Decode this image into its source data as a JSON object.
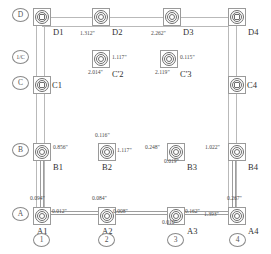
{
  "drawing": {
    "title": "Column Grid Deviation Plan",
    "unit_symbol": "\"",
    "row_bubbles": [
      {
        "label": "D",
        "x": 12,
        "y": 8
      },
      {
        "label": "1/C",
        "x": 12,
        "y": 50
      },
      {
        "label": "C",
        "x": 12,
        "y": 76
      },
      {
        "label": "B",
        "x": 12,
        "y": 143
      },
      {
        "label": "A",
        "x": 12,
        "y": 207
      }
    ],
    "column_bubbles": [
      {
        "label": "1",
        "x": 33,
        "y": 233
      },
      {
        "label": "2",
        "x": 98,
        "y": 233
      },
      {
        "label": "3",
        "x": 167,
        "y": 233
      },
      {
        "label": "4",
        "x": 229,
        "y": 233
      }
    ],
    "columns": [
      {
        "name": "D1",
        "x": 33,
        "y": 8,
        "core": "square",
        "tag_pos": "br"
      },
      {
        "name": "D2",
        "x": 92,
        "y": 8,
        "core": "round",
        "tag_pos": "br"
      },
      {
        "name": "D3",
        "x": 163,
        "y": 8,
        "core": "round",
        "tag_pos": "br"
      },
      {
        "name": "D4",
        "x": 228,
        "y": 8,
        "core": "square",
        "tag_pos": "br"
      },
      {
        "name": "C'2",
        "x": 92,
        "y": 50,
        "core": "round",
        "tag_pos": "br"
      },
      {
        "name": "C'3",
        "x": 160,
        "y": 50,
        "core": "round",
        "tag_pos": "br"
      },
      {
        "name": "C1",
        "x": 33,
        "y": 76,
        "core": "square",
        "tag_pos": "r"
      },
      {
        "name": "C4",
        "x": 228,
        "y": 76,
        "core": "square",
        "tag_pos": "r"
      },
      {
        "name": "B1",
        "x": 33,
        "y": 143,
        "core": "round",
        "tag_pos": "br"
      },
      {
        "name": "B2",
        "x": 98,
        "y": 143,
        "core": "round",
        "tag_pos": "b"
      },
      {
        "name": "B3",
        "x": 167,
        "y": 143,
        "core": "round",
        "tag_pos": "br"
      },
      {
        "name": "B4",
        "x": 228,
        "y": 143,
        "core": "round",
        "tag_pos": "br"
      },
      {
        "name": "A1",
        "x": 33,
        "y": 207,
        "core": "round",
        "tag_pos": "b"
      },
      {
        "name": "A2",
        "x": 98,
        "y": 207,
        "core": "round",
        "tag_pos": "b"
      },
      {
        "name": "A3",
        "x": 167,
        "y": 207,
        "core": "round",
        "tag_pos": "br"
      },
      {
        "name": "A4",
        "x": 228,
        "y": 207,
        "core": "round",
        "tag_pos": "br"
      }
    ],
    "dimensions": [
      {
        "value": "1.312\"",
        "x": 80,
        "y": 31,
        "ref": "D2-left"
      },
      {
        "value": "2.262\"",
        "x": 151,
        "y": 31,
        "ref": "D3-left"
      },
      {
        "value": "1.117\"",
        "x": 112,
        "y": 55,
        "ref": "C'2-right"
      },
      {
        "value": "2.014\"",
        "x": 88,
        "y": 70,
        "ref": "C'2-below"
      },
      {
        "value": "0.115\"",
        "x": 180,
        "y": 55,
        "ref": "C'3-right"
      },
      {
        "value": "2.119\"",
        "x": 155,
        "y": 70,
        "ref": "C'3-below"
      },
      {
        "value": "0.856\"",
        "x": 53,
        "y": 145,
        "ref": "B1-right"
      },
      {
        "value": "0.116\"",
        "x": 95,
        "y": 133,
        "ref": "B2-above"
      },
      {
        "value": "1.117\"",
        "x": 117,
        "y": 148,
        "ref": "B2-right"
      },
      {
        "value": "0.248\"",
        "x": 145,
        "y": 145,
        "ref": "B3-left"
      },
      {
        "value": "0.019\"",
        "x": 164,
        "y": 159,
        "ref": "B3-below"
      },
      {
        "value": "1.022\"",
        "x": 205,
        "y": 145,
        "ref": "B4-left"
      },
      {
        "value": "0.094\"",
        "x": 30,
        "y": 196,
        "ref": "A1-above"
      },
      {
        "value": "0.012\"",
        "x": 52,
        "y": 209,
        "ref": "A1-right"
      },
      {
        "value": "0.084\"",
        "x": 92,
        "y": 196,
        "ref": "A2-above"
      },
      {
        "value": "0.008\"",
        "x": 113,
        "y": 209,
        "ref": "A2-right"
      },
      {
        "value": "0.162\"",
        "x": 185,
        "y": 209,
        "ref": "A3-right"
      },
      {
        "value": "0.010\"",
        "x": 162,
        "y": 220,
        "ref": "A3-below"
      },
      {
        "value": "1.393\"",
        "x": 204,
        "y": 212,
        "ref": "A4-left"
      },
      {
        "value": "0.267\"",
        "x": 227,
        "y": 196,
        "ref": "A4-above"
      }
    ],
    "lines": {
      "grid": [
        {
          "orient": "h",
          "x": 42,
          "y": 17,
          "len": 187
        },
        {
          "orient": "h",
          "x": 42,
          "y": 26,
          "len": 187
        },
        {
          "orient": "v",
          "x": 36,
          "y": 26,
          "len": 181
        },
        {
          "orient": "v",
          "x": 44,
          "y": 26,
          "len": 181
        },
        {
          "orient": "v",
          "x": 228,
          "y": 26,
          "len": 181
        },
        {
          "orient": "v",
          "x": 236,
          "y": 26,
          "len": 181
        }
      ],
      "measure": [
        {
          "orient": "h",
          "x": 42,
          "y": 211,
          "len": 187
        },
        {
          "orient": "h",
          "x": 42,
          "y": 214,
          "len": 187
        },
        {
          "orient": "v",
          "x": 40,
          "y": 152,
          "len": 56
        },
        {
          "orient": "v",
          "x": 43,
          "y": 152,
          "len": 56
        },
        {
          "orient": "v",
          "x": 232,
          "y": 152,
          "len": 56
        },
        {
          "orient": "v",
          "x": 235,
          "y": 152,
          "len": 56
        }
      ]
    }
  }
}
